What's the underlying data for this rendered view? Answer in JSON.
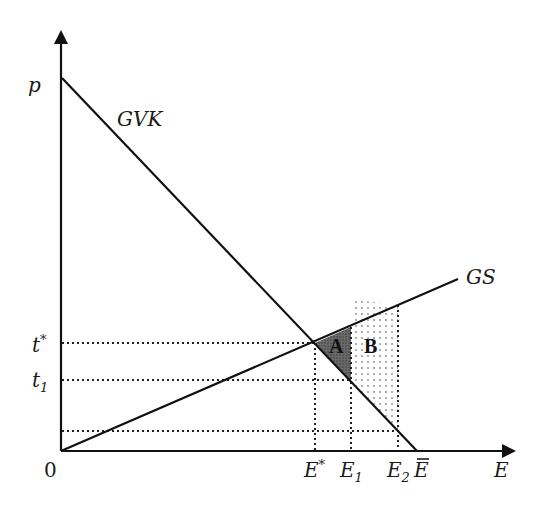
{
  "diagram": {
    "axes": {
      "y_label": "p",
      "x_label": "E",
      "origin_label": "0"
    },
    "curves": {
      "demand": {
        "label": "GVK"
      },
      "supply": {
        "label": "GS"
      }
    },
    "price_levels": [
      {
        "base": "t",
        "mark": "*"
      },
      {
        "base": "t",
        "mark": "1"
      }
    ],
    "quantity_levels": [
      {
        "base": "E",
        "mark": "*"
      },
      {
        "base": "E",
        "mark": "1"
      },
      {
        "base": "E",
        "mark": "2"
      },
      {
        "base": "E",
        "mark": "‾"
      }
    ],
    "regions": {
      "a": {
        "label": "A",
        "fill": "#555555"
      },
      "b": {
        "label": "B",
        "fill": "dotted"
      }
    }
  }
}
